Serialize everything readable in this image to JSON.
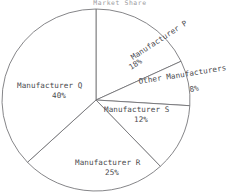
{
  "chart_data": {
    "type": "pie",
    "title": "Market Share",
    "categories": [
      "Manufacturer P",
      "Other Manufacturers",
      "Manufacturer S",
      "Manufacturer R",
      "Manufacturer Q"
    ],
    "values": [
      18,
      8,
      12,
      25,
      40
    ],
    "value_labels": [
      "18%",
      "8%",
      "12%",
      "25%",
      "40%"
    ],
    "unit": "%",
    "total": 100,
    "start_angle_deg": 0,
    "direction": "clockwise",
    "legend": "none",
    "grid": false,
    "slices": [
      {
        "name": "Manufacturer P",
        "value": 18,
        "value_label": "18%",
        "start_deg": 0,
        "end_deg": 64.8,
        "label_rotation_deg": -33,
        "label_x": 133,
        "label_y": 60,
        "pct_x": 131,
        "pct_y": 70
      },
      {
        "name": "Other Manufacturers",
        "value": 8,
        "value_label": "8%",
        "start_deg": 64.8,
        "end_deg": 93.6,
        "label_rotation_deg": -9,
        "label_x": 139,
        "label_y": 84,
        "pct_x": 190,
        "pct_y": 92
      },
      {
        "name": "Manufacturer S",
        "value": 12,
        "value_label": "12%",
        "start_deg": 93.6,
        "end_deg": 136.8,
        "label_rotation_deg": 0,
        "label_x": 104,
        "label_y": 112,
        "pct_x": 134,
        "pct_y": 122
      },
      {
        "name": "Manufacturer R",
        "value": 25,
        "value_label": "25%",
        "start_deg": 136.8,
        "end_deg": 226.8,
        "label_rotation_deg": 0,
        "label_x": 75,
        "label_y": 165,
        "pct_x": 105,
        "pct_y": 175
      },
      {
        "name": "Manufacturer Q",
        "value": 40,
        "value_label": "40%",
        "start_deg": 226.8,
        "end_deg": 360,
        "label_rotation_deg": 0,
        "label_x": 17,
        "label_y": 88,
        "pct_x": 52,
        "pct_y": 98
      }
    ],
    "geometry": {
      "center_x": 96,
      "center_y": 100,
      "radius_x": 94,
      "radius_y": 91
    },
    "colors": {
      "slice_fill": "#ffffff",
      "slice_stroke": "#6f6f72",
      "label_text": "#4a4a4e",
      "title_text": "#9a9a9e",
      "background": "#ffffff"
    }
  }
}
